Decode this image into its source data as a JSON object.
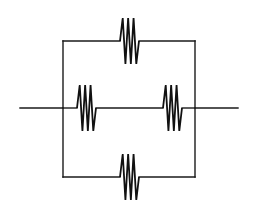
{
  "diagram": {
    "type": "circuit",
    "canvas": {
      "width": 260,
      "height": 207,
      "background": "#ffffff"
    },
    "colors": {
      "wire": "#1a1a1a",
      "resistor": "#111111"
    },
    "nodes": {
      "left": {
        "x": 63,
        "y": 108
      },
      "right": {
        "x": 195,
        "y": 108
      }
    },
    "wires": [
      {
        "name": "input-lead",
        "points": [
          [
            20,
            108
          ],
          [
            63,
            108
          ]
        ]
      },
      {
        "name": "output-lead",
        "points": [
          [
            195,
            108
          ],
          [
            238,
            108
          ]
        ]
      },
      {
        "name": "left-rail",
        "points": [
          [
            63,
            41
          ],
          [
            63,
            177
          ]
        ]
      },
      {
        "name": "right-rail",
        "points": [
          [
            195,
            41
          ],
          [
            195,
            177
          ]
        ]
      },
      {
        "name": "top-branch-left",
        "points": [
          [
            63,
            41
          ],
          [
            120,
            41
          ]
        ]
      },
      {
        "name": "top-branch-right",
        "points": [
          [
            139,
            41
          ],
          [
            195,
            41
          ]
        ]
      },
      {
        "name": "middle-branch-left",
        "points": [
          [
            63,
            108
          ],
          [
            77,
            108
          ]
        ]
      },
      {
        "name": "middle-branch-center",
        "points": [
          [
            96,
            108
          ],
          [
            163,
            108
          ]
        ]
      },
      {
        "name": "middle-branch-right",
        "points": [
          [
            182,
            108
          ],
          [
            195,
            108
          ]
        ]
      },
      {
        "name": "bottom-branch-left",
        "points": [
          [
            63,
            177
          ],
          [
            120,
            177
          ]
        ]
      },
      {
        "name": "bottom-branch-right",
        "points": [
          [
            139,
            177
          ],
          [
            195,
            177
          ]
        ]
      }
    ],
    "resistors": [
      {
        "name": "resistor-top",
        "x1": 120,
        "x2": 139,
        "y": 41,
        "amplitude": 23,
        "peaks": 3
      },
      {
        "name": "resistor-middle-left",
        "x1": 77,
        "x2": 96,
        "y": 108,
        "amplitude": 23,
        "peaks": 3
      },
      {
        "name": "resistor-middle-right",
        "x1": 163,
        "x2": 182,
        "y": 108,
        "amplitude": 23,
        "peaks": 3
      },
      {
        "name": "resistor-bottom",
        "x1": 120,
        "x2": 139,
        "y": 177,
        "amplitude": 23,
        "peaks": 3
      }
    ]
  }
}
